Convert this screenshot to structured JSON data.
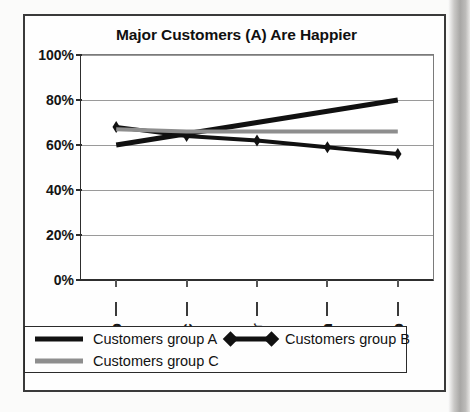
{
  "chart_data": {
    "type": "line",
    "title": "Major Customers (A) Are Happier",
    "xlabel": "",
    "ylabel": "",
    "categories": [
      "Sep",
      "Dec",
      "Mar",
      "Jun",
      "Sep"
    ],
    "ylim": [
      0,
      100
    ],
    "yticks": [
      "0%",
      "20%",
      "40%",
      "60%",
      "80%",
      "100%"
    ],
    "ytick_values": [
      0,
      20,
      40,
      60,
      80,
      100
    ],
    "grid": true,
    "legend_position": "bottom",
    "series": [
      {
        "name": "Customers group A",
        "values": [
          60,
          65,
          70,
          75,
          80
        ],
        "color": "#111111",
        "marker": "none",
        "width": 5
      },
      {
        "name": "Customers group B",
        "values": [
          68,
          64,
          62,
          59,
          56
        ],
        "color": "#111111",
        "marker": "diamond",
        "width": 4
      },
      {
        "name": "Customers group C",
        "values": [
          67,
          66,
          66,
          66,
          66
        ],
        "color": "#8e8e8e",
        "marker": "none",
        "width": 4
      }
    ]
  },
  "legend": {
    "entries": [
      {
        "label": "Customers group A"
      },
      {
        "label": "Customers group B"
      },
      {
        "label": "Customers group C"
      }
    ]
  }
}
